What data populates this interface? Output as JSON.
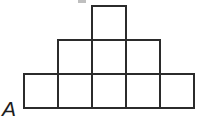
{
  "figure": {
    "label": "A",
    "caption_text": "A",
    "line_color": "#2b2b2b",
    "fill_color": "#ffffff",
    "background_color": "#ffffff",
    "line_width_px": 2,
    "cell_size_px": 34,
    "origin": {
      "x": 24,
      "y": 6
    },
    "rows": [
      {
        "name": "top-row",
        "count": 1,
        "start_column": 2,
        "y": 6
      },
      {
        "name": "middle-row",
        "count": 3,
        "start_column": 1,
        "y": 40
      },
      {
        "name": "bottom-row",
        "count": 5,
        "start_column": 0,
        "y": 74
      }
    ],
    "squares": [
      {
        "id": "r1c3",
        "x": 92,
        "y": 6,
        "w": 34,
        "h": 34
      },
      {
        "id": "r2c2",
        "x": 58,
        "y": 40,
        "w": 34,
        "h": 34
      },
      {
        "id": "r2c3",
        "x": 92,
        "y": 40,
        "w": 34,
        "h": 34
      },
      {
        "id": "r2c4",
        "x": 126,
        "y": 40,
        "w": 34,
        "h": 34
      },
      {
        "id": "r3c1",
        "x": 24,
        "y": 74,
        "w": 34,
        "h": 34
      },
      {
        "id": "r3c2",
        "x": 58,
        "y": 74,
        "w": 34,
        "h": 34
      },
      {
        "id": "r3c3",
        "x": 92,
        "y": 74,
        "w": 34,
        "h": 34
      },
      {
        "id": "r3c4",
        "x": 126,
        "y": 74,
        "w": 34,
        "h": 34
      },
      {
        "id": "r3c5",
        "x": 160,
        "y": 74,
        "w": 34,
        "h": 34
      }
    ],
    "total_squares": 9,
    "artifact": {
      "name": "top-edge-speck",
      "x": 78,
      "y": 0,
      "w": 8,
      "h": 3
    }
  }
}
